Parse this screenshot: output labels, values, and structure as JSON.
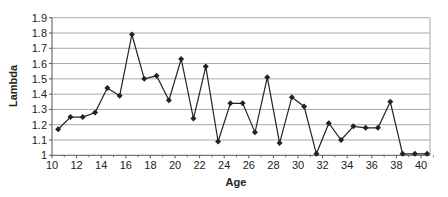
{
  "chart_data": {
    "type": "line",
    "title": "",
    "xlabel": "Age",
    "ylabel": "Lambda",
    "xlim": [
      10,
      41
    ],
    "ylim": [
      1.0,
      1.9
    ],
    "x_ticks": [
      10,
      12,
      14,
      16,
      18,
      20,
      22,
      24,
      26,
      28,
      30,
      32,
      34,
      36,
      38,
      40
    ],
    "y_ticks": [
      1,
      1.1,
      1.2,
      1.3,
      1.4,
      1.5,
      1.6,
      1.7,
      1.8,
      1.9
    ],
    "y_tick_labels": [
      "1",
      "1.1",
      "1.2",
      "1.3",
      "1.4",
      "1.5",
      "1.6",
      "1.7",
      "1.8",
      "1.9"
    ],
    "grid": "horizontal",
    "legend": "none",
    "series": [
      {
        "name": "Lambda",
        "marker": "diamond",
        "color": "#222222",
        "x": [
          10.5,
          11.5,
          12.5,
          13.5,
          14.5,
          15.5,
          16.5,
          17.5,
          18.5,
          19.5,
          20.5,
          21.5,
          22.5,
          23.5,
          24.5,
          25.5,
          26.5,
          27.5,
          28.5,
          29.5,
          30.5,
          31.5,
          32.5,
          33.5,
          34.5,
          35.5,
          36.5,
          37.5,
          38.5,
          39.5,
          40.5
        ],
        "values": [
          1.17,
          1.25,
          1.25,
          1.28,
          1.44,
          1.39,
          1.79,
          1.5,
          1.52,
          1.36,
          1.63,
          1.24,
          1.58,
          1.09,
          1.34,
          1.34,
          1.15,
          1.51,
          1.08,
          1.38,
          1.32,
          1.01,
          1.21,
          1.1,
          1.19,
          1.18,
          1.18,
          1.35,
          1.01,
          1.01,
          1.01
        ]
      }
    ]
  },
  "labels": {
    "xlabel": "Age",
    "ylabel": "Lambda"
  },
  "colors": {
    "line": "#222222",
    "grid": "#a8a8a8",
    "axis": "#555555"
  }
}
